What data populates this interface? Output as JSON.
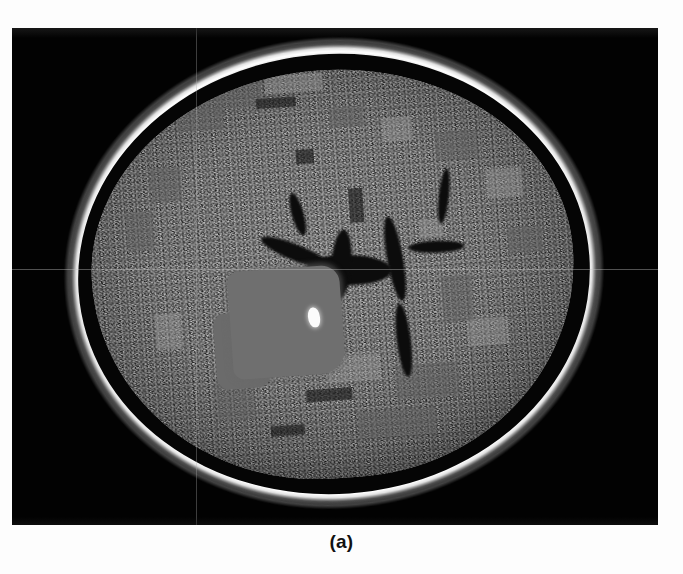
{
  "figure": {
    "caption": "(a)",
    "panel_label": "a",
    "modality": "brain-axial-scan",
    "colors": {
      "page_background": "#fdfdfd",
      "frame_background": "#020202",
      "skull_rim": "#ffffff",
      "brain_tissue": "#6e6e6e",
      "ventricle_dark": "#0c0c0c",
      "lesion_patch": "#6f6f6f",
      "bright_focus": "#fbfbfb",
      "crosshair": "#c8c8c8",
      "caption_text": "#111111"
    },
    "frame": {
      "left": 12,
      "top": 28,
      "width": 646,
      "height": 497
    },
    "crosshair": {
      "horizontal_y": 269,
      "vertical_x": 196
    },
    "regions": [
      {
        "name": "skull-rim",
        "description": "bright hyperdense outer skull ring"
      },
      {
        "name": "scalp-rim",
        "description": "faint outer scalp line"
      },
      {
        "name": "csf-gap",
        "description": "dark cerebrospinal fluid space inside skull"
      },
      {
        "name": "brain-parenchyma",
        "description": "grainy gray brain tissue"
      },
      {
        "name": "ventricles",
        "description": "dark butterfly-shaped central ventricles and sulci"
      },
      {
        "name": "lesion-patch",
        "description": "smooth homogeneous gray lesion in left hemisphere"
      },
      {
        "name": "bright-focus",
        "description": "small hyperintense white focus at lesion margin"
      }
    ]
  }
}
